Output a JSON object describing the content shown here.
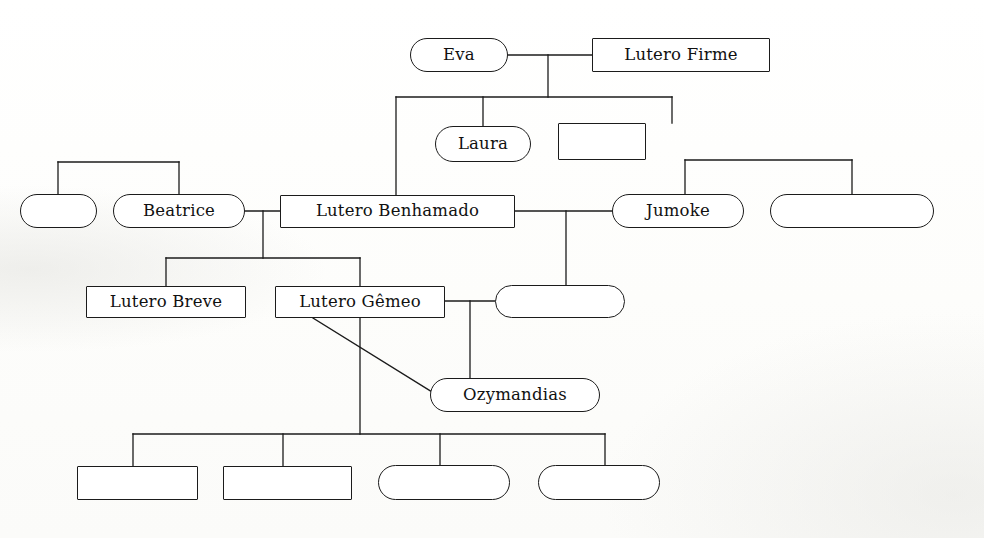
{
  "diagram": {
    "type": "family-tree",
    "stroke_color": "#1b1b1b",
    "node_fill": "#ffffff",
    "background": "#fdfdfc",
    "shape_legend": {
      "rect": "male / rectangle node",
      "round": "female / rounded node"
    }
  },
  "nodes": [
    {
      "id": "eva",
      "label": "Eva",
      "shape": "round",
      "x": 410,
      "y": 38,
      "w": 98,
      "h": 34,
      "empty": false
    },
    {
      "id": "firme",
      "label": "Lutero Firme",
      "shape": "rect",
      "x": 592,
      "y": 38,
      "w": 178,
      "h": 34,
      "empty": false
    },
    {
      "id": "laura",
      "label": "Laura",
      "shape": "round",
      "x": 435,
      "y": 126,
      "w": 96,
      "h": 36,
      "empty": false
    },
    {
      "id": "unnamed-a",
      "label": "",
      "shape": "rect",
      "x": 558,
      "y": 123,
      "w": 88,
      "h": 37,
      "empty": true
    },
    {
      "id": "unnamed-b",
      "label": "",
      "shape": "round",
      "x": 20,
      "y": 194,
      "w": 77,
      "h": 34,
      "empty": true
    },
    {
      "id": "beatrice",
      "label": "Beatrice",
      "shape": "round",
      "x": 113,
      "y": 194,
      "w": 132,
      "h": 34,
      "empty": false
    },
    {
      "id": "benhamado",
      "label": "Lutero Benhamado",
      "shape": "rect",
      "x": 280,
      "y": 195,
      "w": 235,
      "h": 33,
      "empty": false
    },
    {
      "id": "jumoke",
      "label": "Jumoke",
      "shape": "round",
      "x": 612,
      "y": 194,
      "w": 132,
      "h": 34,
      "empty": false
    },
    {
      "id": "unnamed-c",
      "label": "",
      "shape": "round",
      "x": 770,
      "y": 194,
      "w": 164,
      "h": 34,
      "empty": true
    },
    {
      "id": "breve",
      "label": "Lutero Breve",
      "shape": "rect",
      "x": 86,
      "y": 286,
      "w": 160,
      "h": 32,
      "empty": false
    },
    {
      "id": "gemeo",
      "label": "Lutero Gêmeo",
      "shape": "rect",
      "x": 275,
      "y": 286,
      "w": 170,
      "h": 32,
      "empty": false
    },
    {
      "id": "unnamed-d",
      "label": "",
      "shape": "round",
      "x": 495,
      "y": 285,
      "w": 130,
      "h": 33,
      "empty": true
    },
    {
      "id": "ozymandias",
      "label": "Ozymandias",
      "shape": "round",
      "x": 430,
      "y": 378,
      "w": 170,
      "h": 34,
      "empty": false
    },
    {
      "id": "unnamed-e",
      "label": "",
      "shape": "rect",
      "x": 77,
      "y": 466,
      "w": 121,
      "h": 34,
      "empty": true
    },
    {
      "id": "unnamed-f",
      "label": "",
      "shape": "rect",
      "x": 223,
      "y": 466,
      "w": 129,
      "h": 34,
      "empty": true
    },
    {
      "id": "unnamed-g",
      "label": "",
      "shape": "round",
      "x": 378,
      "y": 465,
      "w": 132,
      "h": 35,
      "empty": true
    },
    {
      "id": "unnamed-h",
      "label": "",
      "shape": "round",
      "x": 538,
      "y": 465,
      "w": 122,
      "h": 35,
      "empty": true
    }
  ],
  "edges": [
    {
      "id": "eva-firme-union",
      "kind": "marriage",
      "points": "508,55 592,55"
    },
    {
      "id": "eva-firme-drop",
      "kind": "descent",
      "points": "548,55 548,97"
    },
    {
      "id": "eva-children-bar",
      "kind": "sibling",
      "points": "396,97 672,97"
    },
    {
      "id": "child-benhamado-drop",
      "kind": "descent",
      "points": "396,97 396,195"
    },
    {
      "id": "child-laura-drop",
      "kind": "descent",
      "points": "483,97 483,126"
    },
    {
      "id": "child-unnamed-a-drop",
      "kind": "descent",
      "points": "672,97 672,123"
    },
    {
      "id": "beatrice-sib-bar",
      "kind": "sibling",
      "points": "58,162 179,162"
    },
    {
      "id": "unnamed-b-up",
      "kind": "descent",
      "points": "58,162 58,194"
    },
    {
      "id": "beatrice-up",
      "kind": "descent",
      "points": "179,162 179,194"
    },
    {
      "id": "beatrice-benh-union",
      "kind": "marriage",
      "points": "245,211 280,211"
    },
    {
      "id": "beatrice-benh-drop",
      "kind": "descent",
      "points": "263,211 263,258"
    },
    {
      "id": "benh-children-bar",
      "kind": "sibling",
      "points": "166,258 360,258"
    },
    {
      "id": "breve-drop",
      "kind": "descent",
      "points": "166,258 166,286"
    },
    {
      "id": "gemeo-drop",
      "kind": "descent",
      "points": "360,258 360,286"
    },
    {
      "id": "benh-jumoke-union",
      "kind": "marriage",
      "points": "515,211 612,211"
    },
    {
      "id": "benh-jumoke-drop",
      "kind": "descent",
      "points": "566,211 566,285"
    },
    {
      "id": "jumoke-sib-bar",
      "kind": "sibling",
      "points": "685,160 852,160"
    },
    {
      "id": "jumoke-up",
      "kind": "descent",
      "points": "685,160 685,194"
    },
    {
      "id": "unnamed-c-up",
      "kind": "descent",
      "points": "852,160 852,194"
    },
    {
      "id": "gemeo-union",
      "kind": "marriage",
      "points": "445,301 495,301"
    },
    {
      "id": "gemeo-union-drop",
      "kind": "descent",
      "points": "470,301 470,395"
    },
    {
      "id": "gemeo-ozy-diagonal",
      "kind": "relation",
      "points": "313,318 437,395"
    },
    {
      "id": "gemeo-bottom-drop",
      "kind": "descent",
      "points": "360,318 360,434"
    },
    {
      "id": "bottom-children-bar",
      "kind": "sibling",
      "points": "133,434 605,434"
    },
    {
      "id": "bottom-1-drop",
      "kind": "descent",
      "points": "133,434 133,466"
    },
    {
      "id": "bottom-2-drop",
      "kind": "descent",
      "points": "283,434 283,466"
    },
    {
      "id": "bottom-3-drop",
      "kind": "descent",
      "points": "440,434 440,465"
    },
    {
      "id": "bottom-4-drop",
      "kind": "descent",
      "points": "605,434 605,465"
    }
  ]
}
